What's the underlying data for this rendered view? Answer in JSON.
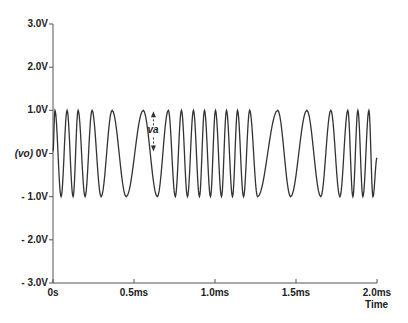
{
  "chart_data": {
    "type": "line",
    "title": "",
    "xlabel": "Time",
    "ylabel": "(vo)",
    "xlim": [
      0,
      2.0
    ],
    "x_unit": "ms",
    "ylim": [
      -3.0,
      3.0
    ],
    "y_unit": "V",
    "grid": false,
    "legend": "none",
    "y_ticks": [
      {
        "value": 3.0,
        "label": "3.0V"
      },
      {
        "value": 2.0,
        "label": "2.0V"
      },
      {
        "value": 1.0,
        "label": "1.0V"
      },
      {
        "value": 0.0,
        "label": "0V",
        "prefix": "(vo)"
      },
      {
        "value": -1.0,
        "label": "- 1.0V"
      },
      {
        "value": -2.0,
        "label": "- 2.0V"
      },
      {
        "value": -3.0,
        "label": "- 3.0V"
      }
    ],
    "x_ticks": [
      {
        "value": 0.0,
        "label": "0s"
      },
      {
        "value": 0.5,
        "label": "0.5ms"
      },
      {
        "value": 1.0,
        "label": "1.0ms"
      },
      {
        "value": 1.5,
        "label": "1.5ms"
      },
      {
        "value": 2.0,
        "label": "2.0ms"
      }
    ],
    "series": [
      {
        "name": "vo",
        "description": "Frequency-modulated sinusoid, amplitude 1.0V, frequency varying over time",
        "amplitude": 1.0,
        "extrema_ms": [
          {
            "t": 0.012,
            "v": 1
          },
          {
            "t": 0.05,
            "v": -1
          },
          {
            "t": 0.087,
            "v": 1
          },
          {
            "t": 0.124,
            "v": -1
          },
          {
            "t": 0.155,
            "v": 1
          },
          {
            "t": 0.198,
            "v": -1
          },
          {
            "t": 0.241,
            "v": 1
          },
          {
            "t": 0.297,
            "v": -1
          },
          {
            "t": 0.365,
            "v": 1
          },
          {
            "t": 0.452,
            "v": -1
          },
          {
            "t": 0.557,
            "v": 1
          },
          {
            "t": 0.644,
            "v": -1
          },
          {
            "t": 0.712,
            "v": 1
          },
          {
            "t": 0.755,
            "v": -1
          },
          {
            "t": 0.793,
            "v": 1
          },
          {
            "t": 0.83,
            "v": -1
          },
          {
            "t": 0.867,
            "v": 1
          },
          {
            "t": 0.904,
            "v": -1
          },
          {
            "t": 0.935,
            "v": 1
          },
          {
            "t": 0.972,
            "v": -1
          },
          {
            "t": 1.003,
            "v": 1
          },
          {
            "t": 1.04,
            "v": -1
          },
          {
            "t": 1.071,
            "v": 1
          },
          {
            "t": 1.108,
            "v": -1
          },
          {
            "t": 1.139,
            "v": 1
          },
          {
            "t": 1.176,
            "v": -1
          },
          {
            "t": 1.214,
            "v": 1
          },
          {
            "t": 1.263,
            "v": -1
          },
          {
            "t": 1.387,
            "v": 1
          },
          {
            "t": 1.467,
            "v": -1
          },
          {
            "t": 1.567,
            "v": 1
          },
          {
            "t": 1.653,
            "v": -1
          },
          {
            "t": 1.715,
            "v": 1
          },
          {
            "t": 1.771,
            "v": -1
          },
          {
            "t": 1.82,
            "v": 1
          },
          {
            "t": 1.851,
            "v": -1
          },
          {
            "t": 1.882,
            "v": 1
          },
          {
            "t": 1.913,
            "v": -1
          },
          {
            "t": 1.95,
            "v": 1
          },
          {
            "t": 1.975,
            "v": -1
          }
        ],
        "end": {
          "t": 2.0,
          "v": -0.1
        }
      }
    ],
    "annotations": [
      {
        "text": "va",
        "type": "double-arrow",
        "x_ms": 0.62,
        "from_v": 1.0,
        "to_v": -0.0
      }
    ]
  }
}
